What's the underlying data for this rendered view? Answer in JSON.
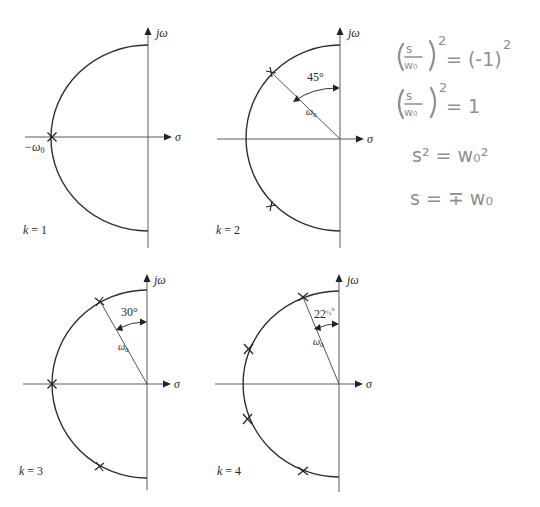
{
  "figure": {
    "axis_labels": {
      "imag": "jω",
      "real": "σ"
    },
    "panels": [
      {
        "id": "k1",
        "label": "k = 1",
        "origin": [
          148,
          137
        ],
        "radius": 96,
        "poles_deg_from_neg_real": [
          0
        ],
        "point_label": "−ω",
        "point_label_sub": "0",
        "angle_label": "",
        "radius_label": ""
      },
      {
        "id": "k2",
        "label": "k = 2",
        "origin": [
          340,
          139
        ],
        "radius": 94,
        "poles_deg_from_neg_real": [
          45,
          -45
        ],
        "angle_label": "45°",
        "radius_label": "ω",
        "radius_label_sub": "0"
      },
      {
        "id": "k3",
        "label": "k = 3",
        "origin": [
          147,
          384
        ],
        "radius": 94,
        "poles_deg_from_neg_real": [
          60,
          -60,
          0
        ],
        "angle_label": "30°",
        "radius_label": "ω",
        "radius_label_sub": "0"
      },
      {
        "id": "k4",
        "label": "k = 4",
        "origin": [
          339,
          384
        ],
        "radius": 93,
        "poles_deg_from_neg_real": [
          67.5,
          22.5,
          -22.5,
          -67.5
        ],
        "angle_label_main": "22",
        "angle_label_frac": "½",
        "angle_label_deg": "°",
        "radius_label": "ω",
        "radius_label_sub": "0"
      }
    ]
  },
  "handwritten_notes": {
    "color": "#8f8f8f",
    "lines": [
      {
        "lhs_num": "s",
        "lhs_den": "w₀",
        "lhs_exp": "2",
        "rhs": "= (-1)",
        "rhs_exp": "2"
      },
      {
        "lhs_num": "s",
        "lhs_den": "w₀",
        "lhs_exp": "2",
        "rhs": "= 1"
      },
      {
        "text": "s² = w₀²"
      },
      {
        "text": "s = ∓ w₀"
      }
    ]
  }
}
